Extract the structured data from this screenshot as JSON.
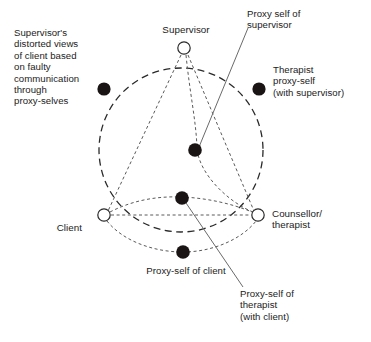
{
  "figure": {
    "type": "relationship-diagram",
    "background_color": "#ffffff",
    "stroke_color": "#2a2a2a",
    "node_fill_open": "#ffffff",
    "node_fill_solid": "#1a1414"
  },
  "nodes": {
    "supervisor": {
      "label": "Supervisor",
      "style": "open-circle",
      "x": 184,
      "y": 48
    },
    "client": {
      "label": "Client",
      "style": "open-circle",
      "x": 104,
      "y": 215
    },
    "counsellor": {
      "label": "Counsellor/\ntherapist",
      "style": "open-circle",
      "x": 258,
      "y": 215
    }
  },
  "proxy_nodes": {
    "distorted_views": {
      "label": "Supervisor's\ndistorted views\nof client based\non faulty\ncommunication\nthrough\nproxy-selves",
      "style": "solid-dot",
      "x": 104,
      "y": 89
    },
    "proxy_self_of_supervisor": {
      "label": "Proxy self of\nsupervisor",
      "style": "solid-dot",
      "x": 195,
      "y": 150
    },
    "therapist_proxy_self_with_supervisor": {
      "label": "Therapist\nproxy-self\n(with supervisor)",
      "style": "solid-dot",
      "x": 259,
      "y": 89
    },
    "proxy_self_of_therapist_with_client": {
      "label": "Proxy-self of\ntherapist\n(with client)",
      "style": "solid-dot",
      "x": 182,
      "y": 198
    },
    "proxy_self_of_client": {
      "label": "Proxy-self of client",
      "style": "solid-dot",
      "x": 183,
      "y": 252
    }
  },
  "geometry": {
    "circle": {
      "cx": 181,
      "cy": 150,
      "r": 82,
      "style": "dashed"
    }
  }
}
